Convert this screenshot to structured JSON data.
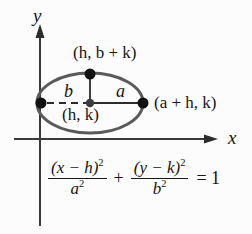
{
  "figure": {
    "background_color": "#fcfcfc",
    "ink_color": "#161616",
    "curve_color": "#5a5a5a",
    "axes": {
      "x_label": "x",
      "y_label": "y",
      "origin_px": {
        "x": 40,
        "y": 139
      }
    },
    "ellipse": {
      "center_px": {
        "x": 90,
        "y": 103
      },
      "semi_major_px": 53,
      "semi_minor_px": 30,
      "center_label": "(h, k)",
      "top_vertex_label": "(h, b + k)",
      "right_vertex_label": "(a + h, k)",
      "semi_major_label": "a",
      "semi_minor_label": "b"
    },
    "equation": {
      "numerator_1": "(x − h)",
      "numerator_1_exp": "2",
      "denominator_1": "a",
      "denominator_1_exp": "2",
      "operator": "+",
      "numerator_2": "(y − k)",
      "numerator_2_exp": "2",
      "denominator_2": "b",
      "denominator_2_exp": "2",
      "equals": "= 1",
      "plain_text": "(x − h)²/a² + (y − k)²/b² = 1"
    }
  }
}
